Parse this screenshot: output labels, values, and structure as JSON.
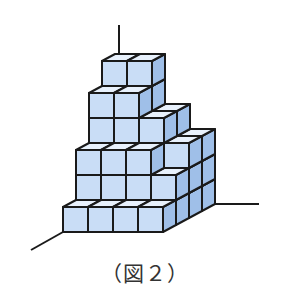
{
  "caption": "（図２）",
  "colors": {
    "front": "#c9ddf6",
    "top": "#e8f1fc",
    "side": "#9fbfe8",
    "edge": "#1a1a1a"
  },
  "geometry": {
    "origin_x": 63,
    "origin_y": 232,
    "cube_size": 25,
    "depth_dx": 13,
    "depth_dy": -7
  },
  "axes": [
    {
      "name": "vertical-axis",
      "x1": 119,
      "y1": 25,
      "x2": 119,
      "y2": 56
    },
    {
      "name": "left-axis",
      "x1": 31,
      "y1": 250,
      "x2": 63,
      "y2": 232
    },
    {
      "name": "right-axis",
      "x1": 215,
      "y1": 204,
      "x2": 259,
      "y2": 204
    }
  ],
  "heights": [
    [
      1,
      1,
      1,
      1
    ],
    [
      3,
      3,
      3,
      2
    ],
    [
      5,
      5,
      4,
      3
    ],
    [
      6,
      6,
      4,
      3
    ]
  ]
}
